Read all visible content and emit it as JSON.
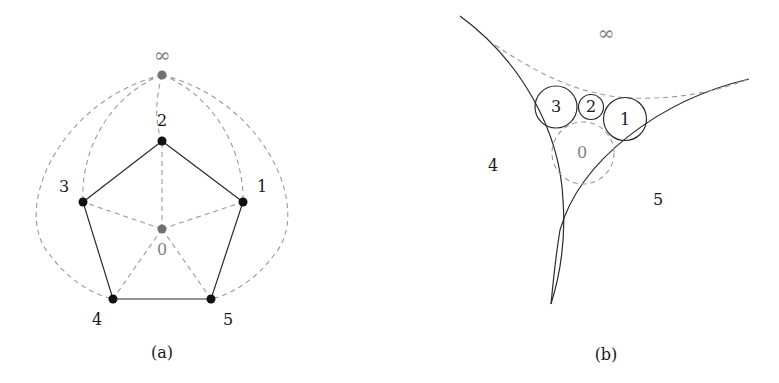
{
  "panel_a": {
    "caption": "(a)",
    "labels": {
      "infinity": "∞",
      "v0": "0",
      "v1": "1",
      "v2": "2",
      "v3": "3",
      "v4": "4",
      "v5": "5"
    },
    "colors": {
      "vertex": "#111111",
      "special_vertex": "#707070",
      "edge": "#2a2a2a",
      "dashed_edge": "#9a9a9a"
    },
    "solid_edges": [
      [
        "1",
        "2"
      ],
      [
        "2",
        "3"
      ],
      [
        "3",
        "4"
      ],
      [
        "4",
        "5"
      ],
      [
        "5",
        "1"
      ]
    ],
    "dashed_edges": [
      [
        "0",
        "1"
      ],
      [
        "0",
        "2"
      ],
      [
        "0",
        "3"
      ],
      [
        "0",
        "4"
      ],
      [
        "0",
        "5"
      ],
      [
        "∞",
        "1"
      ],
      [
        "∞",
        "2"
      ],
      [
        "∞",
        "3"
      ],
      [
        "∞",
        "4"
      ],
      [
        "∞",
        "5"
      ]
    ]
  },
  "panel_b": {
    "caption": "(b)",
    "labels": {
      "infinity": "∞",
      "c0": "0",
      "c1": "1",
      "c2": "2",
      "c3": "3",
      "r4": "4",
      "r5": "5"
    },
    "colors": {
      "circle": "#2a2a2a",
      "dashed_circle": "#9a9a9a"
    }
  }
}
